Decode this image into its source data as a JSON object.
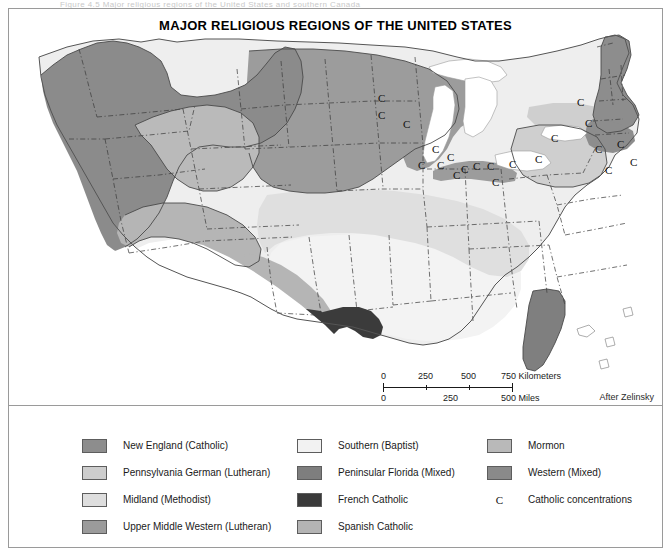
{
  "top_clip_text": "Figure 4.5   Major religious regions of the United States and southern Canada",
  "map": {
    "title": "MAJOR RELIGIOUS REGIONS OF THE UNITED STATES",
    "attribution": "After Zelinsky",
    "scalebar": {
      "km_labels": [
        "0",
        "250",
        "500",
        "750 Kilometers"
      ],
      "mi_labels": [
        "0",
        "250",
        "500 Miles"
      ]
    },
    "catholic_markers_label": "C",
    "catholic_marker_count": 21
  },
  "legend": {
    "columns": [
      {
        "items": [
          {
            "label": "New England (Catholic)",
            "color": "#8d8d8d",
            "kind": "swatch",
            "name": "new-england-catholic"
          },
          {
            "label": "Pennsylvania German (Lutheran)",
            "color": "#cdcdcd",
            "kind": "swatch",
            "name": "pennsylvania-german-lutheran"
          },
          {
            "label": "Midland (Methodist)",
            "color": "#dedede",
            "kind": "swatch",
            "name": "midland-methodist"
          },
          {
            "label": "Upper Middle Western (Lutheran)",
            "color": "#9b9b9b",
            "kind": "swatch",
            "name": "upper-middle-western-lutheran"
          }
        ]
      },
      {
        "items": [
          {
            "label": "Southern (Baptist)",
            "color": "#f2f2f2",
            "kind": "swatch",
            "name": "southern-baptist"
          },
          {
            "label": "Peninsular Florida (Mixed)",
            "color": "#7e7e7e",
            "kind": "swatch",
            "name": "peninsular-florida-mixed"
          },
          {
            "label": "French Catholic",
            "color": "#3a3a3a",
            "kind": "swatch",
            "name": "french-catholic"
          },
          {
            "label": "Spanish Catholic",
            "color": "#b4b4b4",
            "kind": "swatch",
            "name": "spanish-catholic"
          }
        ]
      },
      {
        "items": [
          {
            "label": "Mormon",
            "color": "#b9b9b9",
            "kind": "swatch",
            "name": "mormon"
          },
          {
            "label": "Western (Mixed)",
            "color": "#8a8a8a",
            "kind": "swatch",
            "name": "western-mixed"
          },
          {
            "label": "Catholic concentrations",
            "color": "#111111",
            "kind": "letter",
            "glyph": "C",
            "name": "catholic-concentrations"
          }
        ]
      }
    ]
  },
  "colors": {
    "new_england": "#8d8d8d",
    "penn_german": "#cdcdcd",
    "midland": "#dedede",
    "upper_middle_western": "#9b9b9b",
    "southern": "#f2f2f2",
    "peninsular_florida": "#7e7e7e",
    "french_catholic": "#3a3a3a",
    "spanish_catholic": "#b4b4b4",
    "mormon": "#b9b9b9",
    "western_mixed": "#8a8a8a",
    "water": "#ffffff",
    "outside": "#ffffff",
    "border": "#404040",
    "frame": "#9a9a9a"
  },
  "c_markers": [
    {
      "x": 369,
      "y": 84
    },
    {
      "x": 369,
      "y": 101
    },
    {
      "x": 394,
      "y": 110
    },
    {
      "x": 423,
      "y": 135
    },
    {
      "x": 409,
      "y": 151
    },
    {
      "x": 428,
      "y": 151
    },
    {
      "x": 452,
      "y": 155
    },
    {
      "x": 438,
      "y": 143
    },
    {
      "x": 483,
      "y": 168
    },
    {
      "x": 464,
      "y": 152
    },
    {
      "x": 444,
      "y": 161
    },
    {
      "x": 478,
      "y": 152
    },
    {
      "x": 500,
      "y": 150
    },
    {
      "x": 526,
      "y": 145
    },
    {
      "x": 542,
      "y": 124
    },
    {
      "x": 576,
      "y": 109
    },
    {
      "x": 586,
      "y": 135
    },
    {
      "x": 568,
      "y": 88
    },
    {
      "x": 608,
      "y": 130
    },
    {
      "x": 621,
      "y": 148
    },
    {
      "x": 596,
      "y": 156
    }
  ]
}
